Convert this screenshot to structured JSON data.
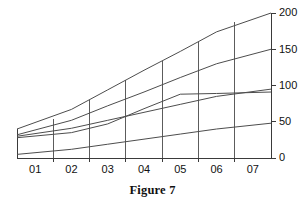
{
  "caption": "Figure 7",
  "chart_data": {
    "type": "line",
    "title": "",
    "xlabel": "",
    "ylabel": "",
    "categories": [
      "01",
      "02",
      "03",
      "04",
      "05",
      "06",
      "07"
    ],
    "x_tick_labels": [
      "01",
      "02",
      "03",
      "04",
      "05",
      "06",
      "07"
    ],
    "y_tick_labels": [
      "0",
      "50",
      "100",
      "150",
      "200"
    ],
    "y_ticks": [
      0,
      50,
      100,
      150,
      200
    ],
    "ylim": [
      0,
      200
    ],
    "grid": "vertical",
    "y_axis_position": "right",
    "legend": "none",
    "series": [
      {
        "name": "series-1",
        "values": [
          40,
          67,
          94,
          121,
          147,
          174,
          200
        ]
      },
      {
        "name": "series-2",
        "values": [
          32,
          52,
          72,
          91,
          111,
          130,
          150
        ]
      },
      {
        "name": "series-3",
        "values": [
          28,
          35,
          47,
          68,
          88,
          89,
          91
        ]
      },
      {
        "name": "series-4",
        "values": [
          30,
          41,
          52,
          63,
          74,
          85,
          95
        ]
      },
      {
        "name": "series-5",
        "values": [
          5,
          12,
          19,
          26,
          33,
          40,
          48
        ]
      }
    ]
  }
}
